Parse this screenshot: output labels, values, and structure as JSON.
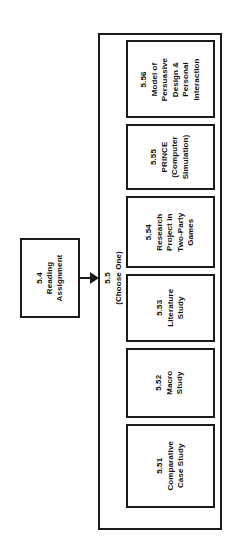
{
  "diagram": {
    "type": "flowchart",
    "orientation": "rotated-90-ccw",
    "colors": {
      "background": "#ffffff",
      "stroke": "#1a1a1a",
      "text": "#111111"
    },
    "source_node": {
      "id": "5.4",
      "number": "5.4",
      "lines": [
        "5.4",
        "Reading",
        "Assignment"
      ],
      "label": "5.4 Reading Assignment"
    },
    "edge": {
      "arrow": "arrow-right",
      "lines": [
        "5.5",
        "(Choose One)"
      ],
      "number": "5.5",
      "qualifier": "(Choose One)"
    },
    "group": {
      "label": "",
      "options": [
        {
          "id": "5.56",
          "number": "5.56",
          "lines": [
            "5.56",
            "Model of",
            "Persuasive",
            "Design &",
            "Personal",
            "Interaction"
          ],
          "label": "5.56 Model of Persuasive Design & Personal Interaction"
        },
        {
          "id": "5.55",
          "number": "5.55",
          "lines": [
            "5.55",
            "PRINCE",
            "(Computer",
            "Simulation)"
          ],
          "label": "5.55 PRINCE (Computer Simulation)"
        },
        {
          "id": "5.54",
          "number": "5.54",
          "lines": [
            "5.54",
            "Research",
            "Project in",
            "Two-Party",
            "Games"
          ],
          "label": "5.54 Research Project in Two-Party Games"
        },
        {
          "id": "5.53",
          "number": "5.53",
          "lines": [
            "5.53",
            "Literature",
            "Study"
          ],
          "label": "5.53 Literature Study"
        },
        {
          "id": "5.52",
          "number": "5.52",
          "lines": [
            "5.52",
            "Macro",
            "Study"
          ],
          "label": "5.52 Macro Study"
        },
        {
          "id": "5.51",
          "number": "5.51",
          "lines": [
            "5.51",
            "Comparative",
            "Case Study"
          ],
          "label": "5.51 Comparative Case Study"
        }
      ]
    }
  }
}
